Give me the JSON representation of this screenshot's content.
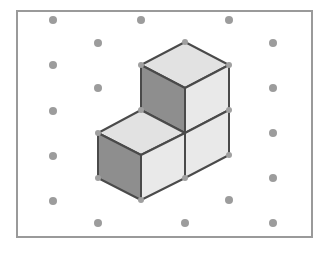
{
  "diagram": {
    "type": "isometric-dot-grid",
    "frame": {
      "x": 17,
      "y": 11,
      "width": 295,
      "height": 226,
      "stroke": "#9a9a9a"
    },
    "dot_color": "#9c9c9c",
    "dots": [
      [
        53,
        20
      ],
      [
        141,
        20
      ],
      [
        229,
        20
      ],
      [
        98,
        43
      ],
      [
        273,
        43
      ],
      [
        53,
        65
      ],
      [
        98,
        88
      ],
      [
        273,
        88
      ],
      [
        53,
        111
      ],
      [
        273,
        133
      ],
      [
        53,
        156
      ],
      [
        273,
        178
      ],
      [
        53,
        201
      ],
      [
        229,
        200
      ],
      [
        98,
        223
      ],
      [
        185,
        223
      ],
      [
        273,
        223
      ]
    ],
    "cube_count": 3,
    "colors": {
      "top_face": "#e2e2e2",
      "left_face": "#8e8e8e",
      "right_face": "#e9e9e9",
      "edge": "#4a4a4a"
    },
    "faces": [
      {
        "name": "upper-cube-top",
        "shade": "top_face",
        "points": "185,42 229,65 185,88 141,65"
      },
      {
        "name": "upper-cube-left",
        "shade": "left_face",
        "points": "141,65 185,88 185,133 141,110"
      },
      {
        "name": "upper-cube-right",
        "shade": "right_face",
        "points": "185,88 229,65 229,110 185,133"
      },
      {
        "name": "back-lower-cube-right",
        "shade": "right_face",
        "points": "185,133 229,110 229,155 185,178"
      },
      {
        "name": "front-cube-top",
        "shade": "top_face",
        "points": "141,110 185,133 141,155 98,133"
      },
      {
        "name": "front-cube-left",
        "shade": "left_face",
        "points": "98,133 141,155 141,200 98,178"
      },
      {
        "name": "front-cube-right",
        "shade": "right_face",
        "points": "141,155 185,133 185,178 141,200"
      }
    ],
    "vertices": [
      [
        185,
        42
      ],
      [
        141,
        65
      ],
      [
        229,
        65
      ],
      [
        229,
        110
      ],
      [
        141,
        110
      ],
      [
        98,
        133
      ],
      [
        229,
        155
      ],
      [
        98,
        178
      ],
      [
        141,
        200
      ],
      [
        185,
        178
      ]
    ]
  }
}
